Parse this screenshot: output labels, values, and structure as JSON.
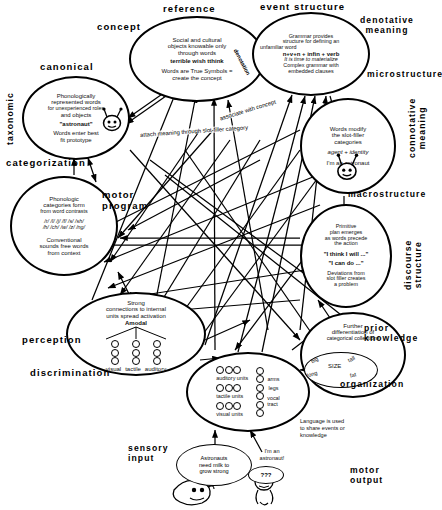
{
  "sections": [
    {
      "name": "reference",
      "label": "reference"
    },
    {
      "name": "concept",
      "label": "concept"
    },
    {
      "name": "event-structure",
      "label": "event structure"
    },
    {
      "name": "denotative-meaning",
      "label": "denotative\nmeaning"
    },
    {
      "name": "canonical",
      "label": "canonical"
    },
    {
      "name": "microstructure",
      "label": "microstructure"
    },
    {
      "name": "taxonomic",
      "label": "taxonomic"
    },
    {
      "name": "connotative-meaning",
      "label": "connotative\nmeaning"
    },
    {
      "name": "categorization",
      "label": "categorization"
    },
    {
      "name": "motor-program",
      "label": "motor\nprogram"
    },
    {
      "name": "macrostructure",
      "label": "macrostructure"
    },
    {
      "name": "discourse-structure",
      "label": "discourse\nstructure"
    },
    {
      "name": "perception",
      "label": "perception"
    },
    {
      "name": "prior-knowledge",
      "label": "prior\nknowledge"
    },
    {
      "name": "discrimination",
      "label": "discrimination"
    },
    {
      "name": "organization",
      "label": "organization"
    },
    {
      "name": "sensory-input",
      "label": "sensory\ninput"
    },
    {
      "name": "motor-output",
      "label": "motor\noutput"
    }
  ],
  "nodes": {
    "reference": {
      "name": "reference-node",
      "lines": [
        {
          "text": "Social and cultural",
          "style": "plain"
        },
        {
          "text": "objects knowable only",
          "style": "plain"
        },
        {
          "text": "through words",
          "style": "plain"
        },
        {
          "text": "terrible   wish   tthink",
          "style": "bold"
        },
        {
          "text": "",
          "style": "plain"
        },
        {
          "text": "Words are True Symbols =",
          "style": "plain"
        },
        {
          "text": "create the concept",
          "style": "plain"
        }
      ],
      "side_word": "denotation"
    },
    "event_structure": {
      "name": "event-structure-node",
      "lines": [
        {
          "text": "Grammar provides",
          "style": "plain"
        },
        {
          "text": "structure for defining an",
          "style": "plain"
        },
        {
          "text": "unfamiliar word",
          "style": "plain"
        },
        {
          "text": "n+v+n  +  infin  +  verb",
          "style": "bold"
        },
        {
          "text": "It is time to    materialize",
          "style": "italic"
        },
        {
          "text": "Complex grammar with",
          "style": "plain"
        },
        {
          "text": "embedded clauses",
          "style": "plain"
        }
      ]
    },
    "canonical": {
      "name": "canonical-node",
      "lines": [
        {
          "text": "Phonologically",
          "style": "plain"
        },
        {
          "text": "represented words",
          "style": "plain"
        },
        {
          "text": "for unexperienced roles",
          "style": "plain"
        },
        {
          "text": "and objects",
          "style": "plain"
        },
        {
          "text": "\"astronaut\"",
          "style": "bold"
        },
        {
          "text": "Words enter best",
          "style": "plain"
        },
        {
          "text": "fit prototype",
          "style": "plain"
        }
      ]
    },
    "microstructure": {
      "name": "microstructure-node",
      "lines": [
        {
          "text": "Words modify",
          "style": "plain"
        },
        {
          "text": "the slot-filler",
          "style": "plain"
        },
        {
          "text": "categories",
          "style": "plain"
        },
        {
          "text": "agent + identity",
          "style": "italic"
        },
        {
          "text": "I'm   an   astronaut",
          "style": "plain"
        }
      ]
    },
    "categorization": {
      "name": "categorization-node",
      "lines": [
        {
          "text": "Phonologic",
          "style": "plain"
        },
        {
          "text": "categories form",
          "style": "plain"
        },
        {
          "text": "from word contrasts",
          "style": "plain"
        },
        {
          "text": "/r/ /l/ /j/ /f/ /s/ /sh/",
          "style": "italic"
        },
        {
          "text": "/h/ /ch/ /w/ /z/ /ng/",
          "style": "italic"
        },
        {
          "text": "Conventional",
          "style": "plain"
        },
        {
          "text": "sounds free words",
          "style": "plain"
        },
        {
          "text": "from context",
          "style": "plain"
        }
      ]
    },
    "macrostructure": {
      "name": "macrostructure-node",
      "lines": [
        {
          "text": "Primitive",
          "style": "plain"
        },
        {
          "text": "plan emerges",
          "style": "plain"
        },
        {
          "text": "as words precede",
          "style": "plain"
        },
        {
          "text": "the action",
          "style": "plain"
        },
        {
          "text": "\"I think I will ...\"",
          "style": "bold"
        },
        {
          "text": "\"I can do ...\"",
          "style": "bold"
        },
        {
          "text": "Deviations from",
          "style": "plain"
        },
        {
          "text": "slot filler creates",
          "style": "plain"
        },
        {
          "text": "a problem",
          "style": "plain"
        }
      ]
    },
    "perception": {
      "name": "perception-node",
      "lines": [
        {
          "text": "Strong",
          "style": "plain"
        },
        {
          "text": "connections to internal",
          "style": "plain"
        },
        {
          "text": "units spread activation",
          "style": "plain"
        },
        {
          "text": "Amodal",
          "style": "bold"
        }
      ],
      "modality_labels": [
        "visual",
        "tactile",
        "auditory"
      ]
    },
    "prior_knowledge": {
      "name": "prior-knowledge-node",
      "lines": [
        {
          "text": "Further",
          "style": "plain"
        },
        {
          "text": "differentiation of",
          "style": "plain"
        },
        {
          "text": "categorical collections",
          "style": "plain"
        }
      ],
      "size_cluster": {
        "center": "SIZE",
        "items": [
          "big",
          "tall",
          "long",
          "fat"
        ]
      }
    },
    "discrimination": {
      "name": "discrimination-node",
      "left_units": [
        "auditory units",
        "tactile units",
        "visual units"
      ],
      "right_units": [
        "arms",
        "legs",
        "vocal\ntract"
      ]
    }
  },
  "edge_labels": [
    {
      "name": "associate-with-concept",
      "text": "associate with concept"
    },
    {
      "name": "attach-meaning",
      "text": "attach meaning through slot-filler category"
    }
  ],
  "notes": [
    {
      "name": "language-share-note",
      "text": "Language is used\nto share events or\nknowledge"
    }
  ],
  "speech_bubbles": [
    {
      "name": "astronaut-milk-bubble",
      "text": "Astronauts\nneed milk to\ngrow strong"
    },
    {
      "name": "im-an-astronaut-label",
      "text": "I'm an\nastronaut!"
    },
    {
      "name": "question-bubble",
      "text": "???"
    }
  ],
  "colors": {
    "ink": "#000000",
    "paper": "#ffffff",
    "text": "#111111"
  }
}
